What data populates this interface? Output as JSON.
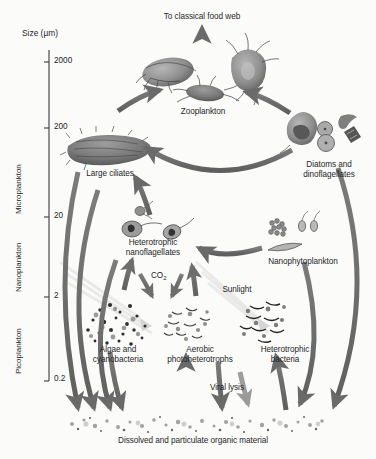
{
  "figure": {
    "background_color": "#fbfbfa",
    "arrow_color": "#6b6b6b",
    "sunlight_ray_color": "#d8d8d8"
  },
  "axis": {
    "title": "Size (µm)",
    "ticks": [
      {
        "label": "2000",
        "y": 62
      },
      {
        "label": "200",
        "y": 128
      },
      {
        "label": "20",
        "y": 217
      },
      {
        "label": "2",
        "y": 297
      },
      {
        "label": "0.2",
        "y": 379
      }
    ],
    "categories": [
      {
        "label": "Microplankton",
        "top": 125,
        "bottom": 218
      },
      {
        "label": "Nanoplankton",
        "top": 218,
        "bottom": 298
      },
      {
        "label": "Picoplankton",
        "top": 298,
        "bottom": 380
      }
    ]
  },
  "nodes": {
    "classical_food_web": "To classical food web",
    "zooplankton": "Zooplankton",
    "large_ciliates": "Large ciliates",
    "diatoms_dinoflagellates": "Diatoms and\ndinoflagellates",
    "heterotrophic_nanoflagellates": "Heterotrophic\nnanoflagellates",
    "nanophytoplankton": "Nanophytoplankton",
    "algae_cyanobacteria": "Algae and\ncyanobacteria",
    "aerobic_photoheterotrophs": "Aerobic\nphotoheterotrophs",
    "heterotrophic_bacteria": "Heterotrophic\nbacteria",
    "dissolved_organic_material": "Dissolved and particulate organic material"
  },
  "annotations": {
    "co2": "CO",
    "co2_sub": "2",
    "sunlight": "Sunlight",
    "viral_lysis": "Viral lysis"
  }
}
